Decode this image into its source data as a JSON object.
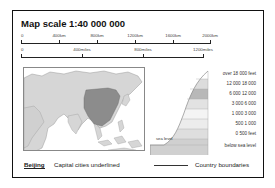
{
  "title": "Map scale 1:40 000 000",
  "km_scale": {
    "ticks": [
      "0",
      "400km",
      "800km",
      "1200km",
      "1600km",
      "2000km"
    ]
  },
  "miles_scale": {
    "ticks": [
      "0",
      "400miles",
      "800miles",
      "1200miles"
    ]
  },
  "elevation_legend": {
    "sea_level_label": "sea level",
    "bands": [
      {
        "label": "over 18 000 feet",
        "color": "#ffffff"
      },
      {
        "label": "12 000  18 000",
        "color": "#dcdcdc"
      },
      {
        "label": "6 000  12 000",
        "color": "#b8b8b8"
      },
      {
        "label": "3 000  6 000",
        "color": "#e2e2e2"
      },
      {
        "label": "1 000  3 000",
        "color": "#f4f4f4"
      },
      {
        "label": "500  1 000",
        "color": "#ececec"
      },
      {
        "label": "0    500 feet",
        "color": "#dedede"
      },
      {
        "label": "below sea level",
        "color": "#d0d0d0"
      }
    ]
  },
  "footer": {
    "capital_example": "Beijing",
    "capital_text": "Capital cities underlined",
    "boundary_text": "Country boundaries"
  },
  "colors": {
    "highlight_country": "#8c8c8c",
    "land": "#d6d6d6",
    "sea": "#ffffff"
  }
}
